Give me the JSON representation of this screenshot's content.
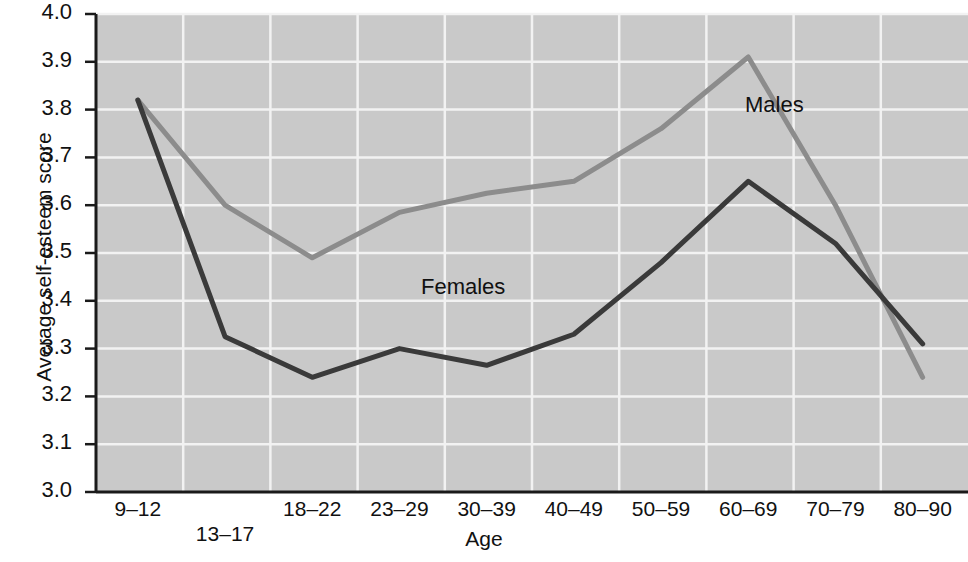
{
  "chart_data": {
    "type": "line",
    "title": "",
    "xlabel": "Age",
    "ylabel": "Average self-esteem score",
    "categories": [
      "9–12",
      "13–17",
      "18–22",
      "23–29",
      "30–39",
      "40–49",
      "50–59",
      "60–69",
      "70–79",
      "80–90"
    ],
    "ylim": [
      3.0,
      4.0
    ],
    "yticks": [
      "3.0",
      "3.1",
      "3.2",
      "3.3",
      "3.4",
      "3.5",
      "3.6",
      "3.7",
      "3.8",
      "3.9",
      "4.0"
    ],
    "grid": true,
    "legend_position": "inline-annotations",
    "series": [
      {
        "name": "Males",
        "color": "#8c8c8c",
        "values": [
          3.82,
          3.6,
          3.49,
          3.585,
          3.625,
          3.65,
          3.76,
          3.91,
          3.6,
          3.24
        ]
      },
      {
        "name": "Females",
        "color": "#3a3a3a",
        "values": [
          3.82,
          3.325,
          3.24,
          3.3,
          3.265,
          3.33,
          3.48,
          3.65,
          3.52,
          3.31
        ]
      }
    ],
    "annotations": [
      {
        "text": "Males",
        "x_px": 745,
        "y_px": 92
      },
      {
        "text": "Females",
        "x_px": 421,
        "y_px": 274
      }
    ],
    "colors": {
      "plot_background": "#c9c9c9",
      "gridline": "#f2f2f2",
      "axis": "#1a1a1a",
      "males_line": "#8c8c8c",
      "females_line": "#3a3a3a",
      "page_background": "#ffffff"
    }
  },
  "axes": {
    "x_tick_rows": [
      0,
      1,
      0,
      0,
      0,
      0,
      0,
      0,
      0,
      0
    ]
  }
}
